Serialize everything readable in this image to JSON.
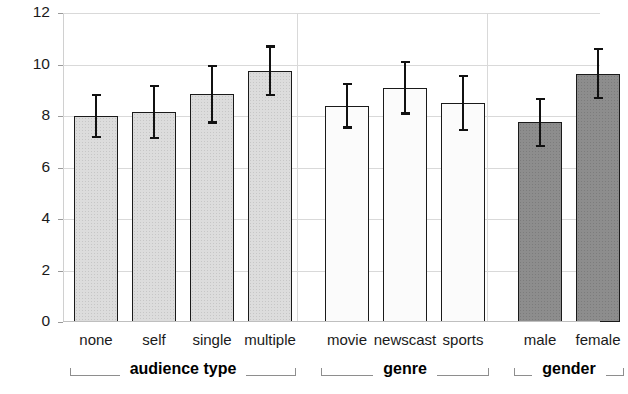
{
  "chart_data": {
    "type": "bar",
    "title": "",
    "xlabel": "",
    "ylabel": "Body Movement [%]",
    "ylim": [
      0,
      12
    ],
    "yticks": [
      0,
      2,
      4,
      6,
      8,
      10,
      12
    ],
    "ytick_labels": [
      "0",
      "2",
      "4",
      "6",
      "8",
      "10",
      "12"
    ],
    "grid": true,
    "grid_axis": "y",
    "legend": null,
    "categories": [
      "none",
      "self",
      "single",
      "multiple",
      "movie",
      "newscast",
      "sports",
      "male",
      "female"
    ],
    "values": [
      8.0,
      8.15,
      8.85,
      9.75,
      8.4,
      9.1,
      8.5,
      7.75,
      9.65
    ],
    "errors": [
      0.8,
      1.0,
      1.1,
      0.95,
      0.85,
      1.0,
      1.05,
      0.9,
      0.95
    ],
    "error_type": "symmetric",
    "bars": [
      {
        "category": "none",
        "value": 8.0,
        "error": 0.8,
        "group": "audience type",
        "fill": "fill-light",
        "color": "#dcdcdc"
      },
      {
        "category": "self",
        "value": 8.15,
        "error": 1.0,
        "group": "audience type",
        "fill": "fill-light",
        "color": "#dcdcdc"
      },
      {
        "category": "single",
        "value": 8.85,
        "error": 1.1,
        "group": "audience type",
        "fill": "fill-light",
        "color": "#dcdcdc"
      },
      {
        "category": "multiple",
        "value": 9.75,
        "error": 0.95,
        "group": "audience type",
        "fill": "fill-light",
        "color": "#dcdcdc"
      },
      {
        "category": "movie",
        "value": 8.4,
        "error": 0.85,
        "group": "genre",
        "fill": "fill-white",
        "color": "#fbfbfb"
      },
      {
        "category": "newscast",
        "value": 9.1,
        "error": 1.0,
        "group": "genre",
        "fill": "fill-white",
        "color": "#fbfbfb"
      },
      {
        "category": "sports",
        "value": 8.5,
        "error": 1.05,
        "group": "genre",
        "fill": "fill-white",
        "color": "#fbfbfb"
      },
      {
        "category": "male",
        "value": 7.75,
        "error": 0.9,
        "group": "gender",
        "fill": "fill-dark",
        "color": "#8d8d8d"
      },
      {
        "category": "female",
        "value": 9.65,
        "error": 0.95,
        "group": "gender",
        "fill": "fill-dark",
        "color": "#8d8d8d"
      }
    ],
    "groups": [
      {
        "label": "audience type",
        "members": [
          "none",
          "self",
          "single",
          "multiple"
        ]
      },
      {
        "label": "genre",
        "members": [
          "movie",
          "newscast",
          "sports"
        ]
      },
      {
        "label": "gender",
        "members": [
          "male",
          "female"
        ]
      }
    ]
  },
  "colors": {
    "bar_light": "#dcdcdc",
    "bar_white": "#fbfbfb",
    "bar_dark": "#8d8d8d",
    "bar_outline": "#1a1a1a",
    "error_bar": "#111111",
    "gridline": "#d9d9d9",
    "background": "#ffffff",
    "text": "#1a1a1a"
  }
}
